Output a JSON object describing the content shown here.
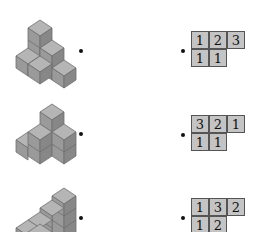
{
  "colors": {
    "cube_top": "#b5b5b5",
    "cube_left": "#9a9a9a",
    "cube_right": "#878787",
    "cube_edge": "#6e6e6e",
    "cell_fill": "#c4c4c4",
    "cell_border": "#555555"
  },
  "rows": [
    {
      "stack_label": "cube-stack-1",
      "grid": {
        "top_row": [
          "1",
          "2",
          "3"
        ],
        "bottom_row": [
          "1",
          "1"
        ]
      }
    },
    {
      "stack_label": "cube-stack-2",
      "grid": {
        "top_row": [
          "3",
          "2",
          "1"
        ],
        "bottom_row": [
          "1",
          "1"
        ]
      }
    },
    {
      "stack_label": "cube-stack-3",
      "grid": {
        "top_row": [
          "1",
          "3",
          "2"
        ],
        "bottom_row": [
          "1",
          "2"
        ]
      }
    }
  ]
}
